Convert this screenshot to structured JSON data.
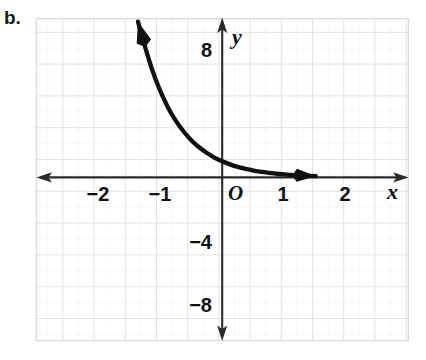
{
  "figure": {
    "part_label": "b.",
    "background_color": "#ffffff",
    "grid": {
      "major_color": "#d8d8d8",
      "minor_color": "#ececec",
      "major_spacing_units_x": 1,
      "major_spacing_units_y": 2,
      "minor_divisions": 2,
      "visible": true
    },
    "axis_color": "#2b2b2b",
    "curve_color": "#111111"
  },
  "chart_data": {
    "type": "line",
    "title": "",
    "subtitle": "",
    "xlabel": "x",
    "ylabel": "y",
    "xlim": [
      -3,
      3
    ],
    "ylim": [
      -10,
      10
    ],
    "grid": true,
    "legend": "none",
    "origin_label": "O",
    "x_tick_labels": [
      "−2",
      "−1",
      "1",
      "2"
    ],
    "x_tick_values": [
      -2,
      -1,
      1,
      2
    ],
    "y_tick_labels": [
      "8",
      "−4",
      "−8"
    ],
    "y_tick_values": [
      8,
      -4,
      -8
    ],
    "x_axis_arrows": "both",
    "y_axis_arrows": "both",
    "series": [
      {
        "name": "exponential decay",
        "description": "decreasing exponential curve with arrows at both ends",
        "arrow_start": true,
        "arrow_end": true,
        "x": [
          -2.7,
          -2.5,
          -2.25,
          -2.0,
          -1.75,
          -1.5,
          -1.25,
          -1.0,
          -0.75,
          -0.5,
          -0.25,
          0.0,
          0.25,
          0.5,
          0.75,
          1.0,
          1.25,
          1.5,
          1.75,
          2.0,
          2.25,
          2.5,
          2.75,
          3.0
        ],
        "y": [
          9.8,
          8.4,
          6.8,
          5.5,
          4.45,
          3.6,
          2.92,
          2.36,
          1.91,
          1.55,
          1.25,
          1.01,
          0.82,
          0.66,
          0.54,
          0.43,
          0.35,
          0.28,
          0.23,
          0.19,
          0.15,
          0.12,
          0.1,
          0.08
        ]
      }
    ]
  }
}
